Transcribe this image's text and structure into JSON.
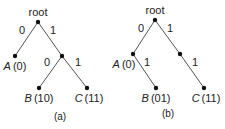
{
  "diagrams": [
    {
      "caption": "(a)",
      "root_label": "root",
      "nodes": {
        "root": {
          "x": 38,
          "y": 22
        },
        "A": {
          "x": 15,
          "y": 56,
          "name": "A",
          "code": "(0)"
        },
        "n1": {
          "x": 62,
          "y": 56
        },
        "B": {
          "x": 39,
          "y": 88,
          "name": "B",
          "code": "(10)"
        },
        "C": {
          "x": 87,
          "y": 88,
          "name": "C",
          "code": "(11)"
        }
      },
      "edges": [
        {
          "from": "root",
          "to": "A",
          "label": "0"
        },
        {
          "from": "root",
          "to": "n1",
          "label": "1"
        },
        {
          "from": "n1",
          "to": "B",
          "label": "0"
        },
        {
          "from": "n1",
          "to": "C",
          "label": "1"
        }
      ]
    },
    {
      "caption": "(b)",
      "root_label": "root",
      "nodes": {
        "root": {
          "x": 155,
          "y": 20
        },
        "A": {
          "x": 133,
          "y": 54,
          "name": "A",
          "code": "(0)"
        },
        "n1": {
          "x": 180,
          "y": 54
        },
        "B": {
          "x": 156,
          "y": 88,
          "name": "B",
          "code": "(01)"
        },
        "C": {
          "x": 204,
          "y": 88,
          "name": "C",
          "code": "(11)"
        }
      },
      "edges": [
        {
          "from": "root",
          "to": "A",
          "label": "0"
        },
        {
          "from": "root",
          "to": "n1",
          "label": "1"
        },
        {
          "from": "A",
          "to": "B",
          "label": "1"
        },
        {
          "from": "n1",
          "to": "C",
          "label": "1"
        }
      ]
    }
  ],
  "colors": {
    "line": "#555555",
    "node": "#111111",
    "text": "#222222"
  }
}
